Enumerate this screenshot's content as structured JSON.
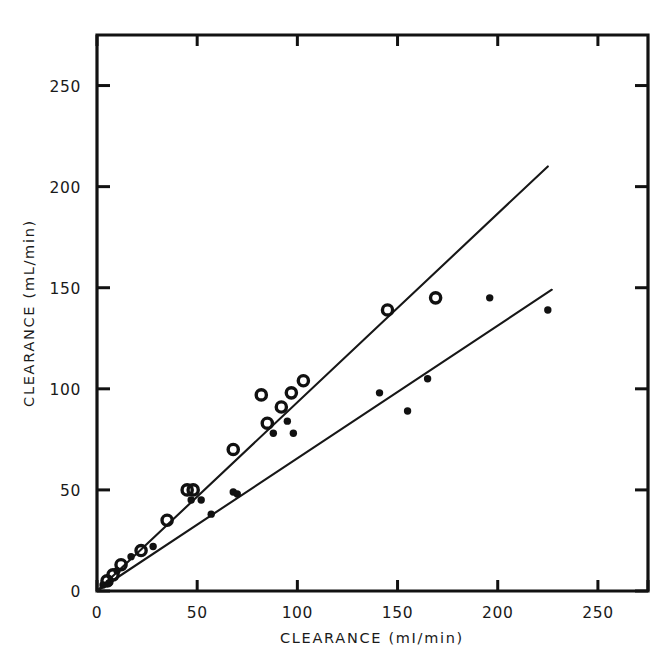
{
  "figure": {
    "background_color": "#ffffff",
    "ink_color": "#121212"
  },
  "chart_data": {
    "type": "scatter",
    "title": "",
    "xlabel": "CLEARANCE   (mI/min)",
    "ylabel": "CLEARANCE   (mL/min)",
    "xlim": [
      0,
      275
    ],
    "ylim": [
      0,
      275
    ],
    "grid": false,
    "legend": "none",
    "xticks": [
      0,
      50,
      100,
      150,
      200,
      250
    ],
    "yticks": [
      0,
      50,
      100,
      150,
      200,
      250
    ],
    "xtick_labels": [
      "0",
      "50",
      "100",
      "150",
      "200",
      "250"
    ],
    "ytick_labels": [
      "0",
      "50",
      "100",
      "150",
      "200",
      "250"
    ],
    "minor_xticks": [
      275
    ],
    "minor_yticks": [
      275
    ],
    "series": [
      {
        "name": "open-circle-series",
        "marker": "open-circle",
        "points": [
          [
            5,
            5
          ],
          [
            8,
            8
          ],
          [
            12,
            13
          ],
          [
            22,
            20
          ],
          [
            35,
            35
          ],
          [
            45,
            50
          ],
          [
            48,
            50
          ],
          [
            68,
            70
          ],
          [
            82,
            97
          ],
          [
            85,
            83
          ],
          [
            92,
            91
          ],
          [
            97,
            98
          ],
          [
            103,
            104
          ],
          [
            145,
            139
          ],
          [
            169,
            145
          ]
        ]
      },
      {
        "name": "filled-dot-series",
        "marker": "filled-dot",
        "points": [
          [
            3,
            3
          ],
          [
            6,
            4
          ],
          [
            10,
            10
          ],
          [
            17,
            17
          ],
          [
            28,
            22
          ],
          [
            47,
            45
          ],
          [
            52,
            45
          ],
          [
            57,
            38
          ],
          [
            68,
            49
          ],
          [
            70,
            48
          ],
          [
            88,
            78
          ],
          [
            95,
            84
          ],
          [
            98,
            78
          ],
          [
            141,
            98
          ],
          [
            155,
            89
          ],
          [
            165,
            105
          ],
          [
            196,
            145
          ],
          [
            225,
            139
          ]
        ]
      }
    ],
    "fit_lines": [
      {
        "name": "steep-regression-line",
        "x0": 0,
        "y0": 0,
        "x1": 225,
        "y1": 210,
        "slope": 0.933
      },
      {
        "name": "shallow-regression-line",
        "x0": 0,
        "y0": 0,
        "x1": 227,
        "y1": 149,
        "slope": 0.656
      }
    ]
  }
}
